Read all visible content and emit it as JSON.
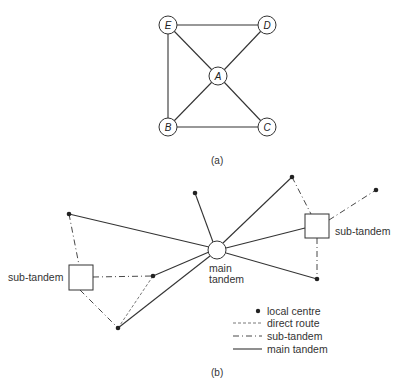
{
  "figure_a": {
    "caption": "(a)",
    "nodes": [
      {
        "id": "E",
        "label": "E",
        "x": 168,
        "y": 25
      },
      {
        "id": "D",
        "label": "D",
        "x": 267,
        "y": 25
      },
      {
        "id": "A",
        "label": "A",
        "x": 218,
        "y": 76
      },
      {
        "id": "B",
        "label": "B",
        "x": 168,
        "y": 127
      },
      {
        "id": "C",
        "label": "C",
        "x": 267,
        "y": 127
      }
    ],
    "edges": [
      [
        "E",
        "D"
      ],
      [
        "E",
        "B"
      ],
      [
        "B",
        "C"
      ],
      [
        "E",
        "A"
      ],
      [
        "D",
        "A"
      ],
      [
        "B",
        "A"
      ],
      [
        "C",
        "A"
      ]
    ]
  },
  "figure_b": {
    "caption": "(b)",
    "main_tandem_label_line1": "main",
    "main_tandem_label_line2": "tandem",
    "left_subtandem_label": "sub-tandem",
    "right_subtandem_label": "sub-tandem",
    "legend": {
      "local_centre": "local centre",
      "direct_route": "direct route",
      "sub_tandem": "sub-tandem",
      "main_tandem": "main tandem"
    }
  },
  "colors": {
    "line": "#333333",
    "node_fill": "#ffffff"
  }
}
